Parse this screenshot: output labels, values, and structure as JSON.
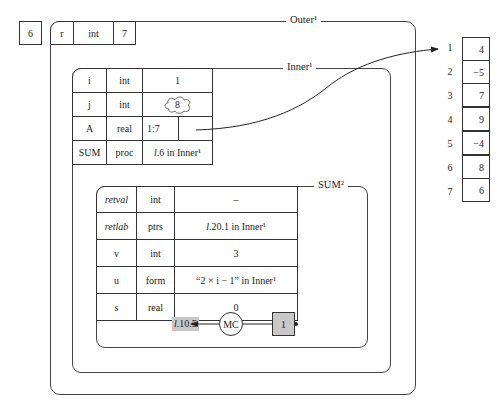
{
  "outside_value": "6",
  "outer": {
    "title": "Outer¹",
    "header": {
      "name": "r",
      "type": "int",
      "value": "7"
    }
  },
  "inner": {
    "title": "Inner¹",
    "rows": [
      {
        "name": "i",
        "type": "int",
        "value": "1"
      },
      {
        "name": "j",
        "type": "int",
        "value": "8"
      },
      {
        "name": "A",
        "type": "real",
        "value": "1:7",
        "value2": ""
      },
      {
        "name": "SUM",
        "type": "proc",
        "value_prefix": "l",
        "value": ".6 in Inner¹"
      }
    ]
  },
  "sum": {
    "title": "SUM²",
    "rows": [
      {
        "name": "retval",
        "type": "int",
        "value": "–"
      },
      {
        "name": "retlab",
        "type": "ptrs",
        "value_prefix": "l",
        "value": ".20.1 in Inner¹"
      },
      {
        "name": "v",
        "type": "int",
        "value": "3"
      },
      {
        "name": "u",
        "type": "form",
        "value": "“2 × i − 1” in Inner¹"
      },
      {
        "name": "s",
        "type": "real",
        "value": "0"
      }
    ],
    "control": {
      "return_label_prefix": "l",
      "return_label": ".10.5",
      "mc_label": "MC",
      "counter": "1"
    }
  },
  "array": {
    "indices": [
      "1",
      "2",
      "3",
      "4",
      "5",
      "6",
      "7"
    ],
    "values": [
      "4",
      "−5",
      "7",
      "9",
      "−4",
      "8",
      "6"
    ]
  }
}
